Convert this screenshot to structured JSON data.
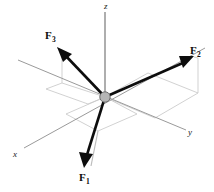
{
  "figure": {
    "type": "vector-diagram",
    "background_color": "#ffffff",
    "axes": {
      "labels": {
        "x": "x",
        "y": "y",
        "z": "z"
      },
      "color": "#9a9a9a",
      "origin_marker": {
        "shape": "circle",
        "fill_color": "#b5b5b5",
        "stroke_color": "#6e6e6e"
      }
    },
    "construction_lines": {
      "color": "#c9c9c9",
      "description": "light gray projection parallelograms and drop lines"
    },
    "vectors": [
      {
        "name": "F1",
        "label_text": "F",
        "label_subscript": "1",
        "direction": "downward and slightly left, below the xy-plane",
        "color": "#0d0d0d"
      },
      {
        "name": "F2",
        "label_text": "F",
        "label_subscript": "2",
        "direction": "upward to the right, above the xy-plane",
        "color": "#0d0d0d"
      },
      {
        "name": "F3",
        "label_text": "F",
        "label_subscript": "3",
        "direction": "upward to the left, above the xy-plane",
        "color": "#0d0d0d"
      }
    ]
  }
}
